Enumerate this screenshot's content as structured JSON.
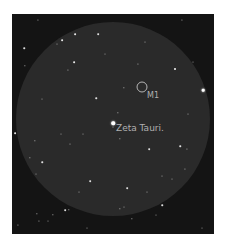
{
  "map": {
    "frame_color": "#141414",
    "field_color": "#2a2a2a",
    "label_color": "#b0b0b0",
    "objects": {
      "m1": {
        "label": "M1",
        "x": 130,
        "y": 73
      },
      "zeta_tauri": {
        "label": "Zeta Tauri.",
        "x": 101,
        "y": 109
      }
    },
    "stars": [
      [
        101,
        109,
        3.2
      ],
      [
        191,
        76,
        2.4
      ],
      [
        152,
        229,
        2.6
      ],
      [
        139,
        229,
        2
      ],
      [
        163,
        55,
        1.8
      ],
      [
        63,
        20,
        1.6
      ],
      [
        86,
        20,
        1.5
      ],
      [
        50,
        26,
        1.6
      ],
      [
        12,
        34,
        1.4
      ],
      [
        62,
        48,
        1.6
      ],
      [
        13,
        52,
        1.2
      ],
      [
        84,
        84,
        1.4
      ],
      [
        112,
        74,
        1.2
      ],
      [
        106,
        99,
        1.2
      ],
      [
        168,
        132,
        1.4
      ],
      [
        137,
        135,
        1.5
      ],
      [
        108,
        125,
        1.2
      ],
      [
        3,
        119,
        1.6
      ],
      [
        23,
        127,
        1.2
      ],
      [
        30,
        148,
        1.4
      ],
      [
        18,
        144,
        1.2
      ],
      [
        78,
        167,
        1.5
      ],
      [
        115,
        174,
        1.5
      ],
      [
        150,
        191,
        1.4
      ],
      [
        108,
        195,
        1.2
      ],
      [
        53,
        196,
        1.5
      ],
      [
        57,
        196,
        1.3
      ],
      [
        25,
        200,
        1.2
      ],
      [
        41,
        201,
        1.2
      ],
      [
        120,
        205,
        1.2
      ],
      [
        27,
        207,
        1
      ],
      [
        6,
        211,
        1
      ],
      [
        170,
        6,
        1
      ],
      [
        26,
        6,
        1
      ],
      [
        126,
        50,
        1
      ],
      [
        56,
        56,
        1
      ],
      [
        133,
        28,
        0.9
      ],
      [
        175,
        135,
        1
      ],
      [
        173,
        155,
        1
      ],
      [
        150,
        162,
        0.9
      ],
      [
        58,
        130,
        0.9
      ],
      [
        45,
        30,
        0.9
      ],
      [
        135,
        178,
        0.9
      ],
      [
        67,
        178,
        0.9
      ],
      [
        101,
        113,
        0.9
      ],
      [
        176,
        100,
        0.9
      ],
      [
        30,
        85,
        0.8
      ],
      [
        49,
        120,
        0.8
      ],
      [
        75,
        214,
        0.9
      ],
      [
        112,
        193,
        0.8
      ],
      [
        160,
        165,
        0.8
      ],
      [
        93,
        40,
        0.8
      ],
      [
        181,
        48,
        0.8
      ],
      [
        144,
        201,
        0.8
      ],
      [
        36,
        207,
        0.8
      ],
      [
        190,
        214,
        0.8
      ],
      [
        71,
        120,
        0.8
      ],
      [
        24,
        160,
        0.8
      ]
    ]
  }
}
